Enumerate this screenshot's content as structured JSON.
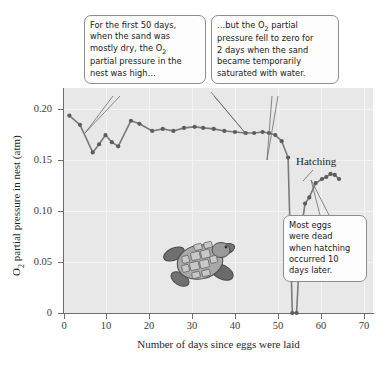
{
  "figure": {
    "axis_title_x": "Number of days since eggs were laid",
    "axis_title_y_pre": "O",
    "axis_title_y_sub": "2",
    "axis_title_y_post": " partial pressure in nest (atm)",
    "hatching_label": "Hatching",
    "turtle_icon": "sea-turtle-hatchling-illustration"
  },
  "callouts": {
    "dry": {
      "id": "callout-first-50-days",
      "line1": "For the first 50 days,",
      "line2": "when the sand was",
      "line3_a": "mostly dry, the O",
      "line3_sub": "2",
      "line4": "partial pressure in the",
      "line5": "nest was high…"
    },
    "saturated": {
      "id": "callout-saturated-sand",
      "line1_a": "…but the O",
      "line1_sub": "2",
      "line1_b": " partial",
      "line2": "pressure fell to zero for",
      "line3": "2 days when the sand",
      "line4": "became temporarily",
      "line5": "saturated with water."
    },
    "dead_eggs": {
      "id": "callout-most-eggs-dead",
      "line1": "Most eggs",
      "line2": "were dead",
      "line3": "when hatching",
      "line4": "occurred 10",
      "line5": "days later."
    }
  },
  "colors": {
    "plot_background": "#e8e8e8",
    "gridline": "#f4f4f4",
    "axis": "#6e6e6e",
    "series_line": "#7a7a7a",
    "series_marker": "#5c5c5c",
    "callout_border": "#8d8d8d",
    "callout_fill": "#fdfdfd",
    "text": "#1f1f1f"
  },
  "chart_data": {
    "type": "line",
    "title": "",
    "xlabel": "Number of days since eggs were laid",
    "ylabel": "O2 partial pressure in nest (atm)",
    "xlim": [
      0,
      73
    ],
    "ylim": [
      0,
      0.22
    ],
    "xticks": [
      0,
      10,
      20,
      30,
      40,
      50,
      60,
      70
    ],
    "xtick_labels": [
      "0",
      "10",
      "20",
      "30",
      "40",
      "50",
      "60",
      "70"
    ],
    "yticks": [
      0,
      0.05,
      0.1,
      0.15,
      0.2
    ],
    "ytick_labels": [
      "0",
      "0.05",
      "0.10",
      "0.15",
      "0.20"
    ],
    "grid": true,
    "legend": "none",
    "series": [
      {
        "name": "O2 partial pressure in nest",
        "marker": "circle",
        "x": [
          1.5,
          4,
          7,
          8.5,
          10,
          11.5,
          13,
          16,
          18,
          21,
          23.5,
          26,
          28.5,
          31,
          33,
          35.5,
          38,
          40.5,
          43,
          45,
          47,
          48.5,
          50,
          51.5,
          53,
          54,
          55,
          56,
          57,
          58,
          59.5,
          61,
          62,
          63,
          64,
          65
        ],
        "y": [
          0.193,
          0.184,
          0.157,
          0.165,
          0.174,
          0.167,
          0.163,
          0.188,
          0.185,
          0.178,
          0.18,
          0.178,
          0.181,
          0.182,
          0.181,
          0.18,
          0.178,
          0.177,
          0.176,
          0.176,
          0.177,
          0.176,
          0.174,
          0.168,
          0.152,
          0.0,
          0.0,
          0.079,
          0.107,
          0.113,
          0.127,
          0.131,
          0.133,
          0.136,
          0.135,
          0.131
        ]
      }
    ],
    "annotations": [
      {
        "text": "Hatching",
        "x": 64,
        "y": 0.158
      },
      {
        "text": "For the first 50 days, when the sand was mostly dry, the O2 partial pressure in the nest was high…",
        "points_to_x": 6
      },
      {
        "text": "…but the O2 partial pressure fell to zero for 2 days when the sand became temporarily saturated with water.",
        "points_to_x": 53
      },
      {
        "text": "Most eggs were dead when hatching occurred 10 days later.",
        "points_to_x": 64
      }
    ]
  }
}
